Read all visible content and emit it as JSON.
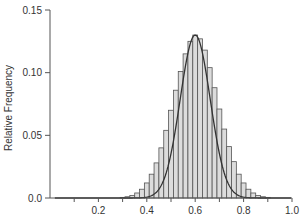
{
  "chart_data": {
    "type": "bar",
    "title": "",
    "xlabel": "",
    "ylabel": "Relative Frequency",
    "xlim": [
      0.0,
      1.0
    ],
    "ylim": [
      0.0,
      0.15
    ],
    "x_ticks": [
      0.1,
      0.2,
      0.3,
      0.4,
      0.5,
      0.6,
      0.7,
      0.8,
      0.9,
      1.0
    ],
    "x_tick_labels": [
      "",
      "0.2",
      "",
      "0.4",
      "",
      "0.6",
      "",
      "0.8",
      "",
      "1.0"
    ],
    "y_ticks": [
      0.0,
      0.05,
      0.1,
      0.15
    ],
    "y_tick_labels": [
      "0.0",
      "0.05",
      "0.10",
      "0.15"
    ],
    "grid": false,
    "legend": null,
    "bin_width": 0.02,
    "bins": [
      0.3,
      0.32,
      0.34,
      0.36,
      0.38,
      0.4,
      0.42,
      0.44,
      0.46,
      0.48,
      0.5,
      0.52,
      0.54,
      0.56,
      0.58,
      0.6,
      0.62,
      0.64,
      0.66,
      0.68,
      0.7,
      0.72,
      0.74,
      0.76,
      0.78,
      0.8,
      0.82,
      0.84,
      0.86,
      0.88,
      0.9
    ],
    "values": [
      0.0005,
      0.001,
      0.002,
      0.004,
      0.007,
      0.012,
      0.019,
      0.028,
      0.04,
      0.054,
      0.07,
      0.086,
      0.101,
      0.115,
      0.125,
      0.13,
      0.127,
      0.118,
      0.104,
      0.088,
      0.071,
      0.055,
      0.041,
      0.029,
      0.019,
      0.012,
      0.007,
      0.004,
      0.002,
      0.001,
      0.0005
    ],
    "overlay_curve": {
      "type": "normal",
      "mean": 0.6,
      "sd": 0.062,
      "peak": 0.13
    },
    "colors": {
      "bar_fill": "#dcdcdc",
      "bar_edge": "#555555",
      "curve": "#333333",
      "axis": "#555555"
    }
  }
}
